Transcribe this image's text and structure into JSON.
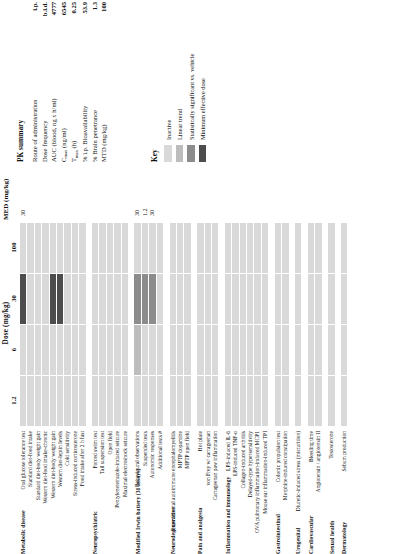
{
  "figure": {
    "dose_axis": {
      "title": "Dose (mg/kg)",
      "ticks": [
        "1.2",
        "6",
        "30",
        "100"
      ]
    },
    "med_column_title": "MED (mg/kg)"
  },
  "colors": {
    "inactive": "#d9d9d9",
    "linear_trend": "#bdbdbd",
    "significant": "#8c8c8c",
    "med": "#4d4d4d",
    "grid_line": "#ffffff",
    "text": "#111111"
  },
  "key": {
    "title": "Key",
    "items": [
      {
        "label": "Inactive",
        "color_key": "inactive"
      },
      {
        "label": "Linear trend",
        "color_key": "linear_trend"
      },
      {
        "label": "Statistically significant vs. vehicle",
        "color_key": "significant"
      },
      {
        "label": "Minimum effective dose",
        "color_key": "med"
      }
    ]
  },
  "pk_summary": {
    "title": "PK summary",
    "rows": [
      {
        "label": "Route of administration",
        "value": "i.p."
      },
      {
        "label": "Dose frequency",
        "value": "b.i.d."
      },
      {
        "label": "AUC (blood, ng x h/ml)",
        "value": "4777"
      },
      {
        "label": "Cmax (ng/ml)",
        "label_main": "C",
        "label_sub": "max",
        "label_tail": " (ng/ml)",
        "value": "6545"
      },
      {
        "label": "Tmax (h)",
        "label_main": "T",
        "label_sub": "max",
        "label_tail": " (h)",
        "value": "0.25"
      },
      {
        "label": "% i.p. Bioavailability",
        "value": "53.9"
      },
      {
        "label": "% Brain penetrance",
        "value": "1.3"
      },
      {
        "label": "MTD (mg/kg)",
        "value": "100"
      }
    ]
  },
  "categories": [
    {
      "name": "Metabolic disease",
      "rows": [
        {
          "label": "Oral glucose tolerance test",
          "cells": [
            "inactive",
            "inactive",
            "med",
            "inactive"
          ],
          "med": "30"
        },
        {
          "label": "Standard diet-food intake",
          "cells": [
            "inactive",
            "inactive",
            "inactive",
            "inactive"
          ],
          "med": ""
        },
        {
          "label": "Standard diet-body weight gain",
          "cells": [
            "inactive",
            "inactive",
            "inactive",
            "inactive"
          ],
          "med": ""
        },
        {
          "label": "Western diet-food intake-chronic",
          "cells": [
            "inactive",
            "inactive",
            "inactive",
            "inactive"
          ],
          "med": ""
        },
        {
          "label": "Western diet-body weight gain",
          "cells": [
            "inactive",
            "inactive",
            "med",
            "inactive"
          ],
          "med": ""
        },
        {
          "label": "Western diet-leptin levels",
          "cells": [
            "inactive",
            "inactive",
            "med",
            "inactive"
          ],
          "med": ""
        },
        {
          "label": "Cold sensitivity",
          "cells": [
            "inactive",
            "inactive",
            "inactive",
            "inactive"
          ],
          "med": ""
        },
        {
          "label": "Stress-induced corticosterone",
          "cells": [
            "inactive",
            "inactive",
            "inactive",
            "inactive"
          ],
          "med": ""
        },
        {
          "label": "Food intake after 2 h fast",
          "cells": [
            "inactive",
            "inactive",
            "inactive",
            "inactive"
          ],
          "med": ""
        }
      ]
    },
    {
      "name": "Neuropsychiatric",
      "rows": [
        {
          "label": "Forced swim test",
          "cells": [
            "inactive",
            "inactive",
            "inactive",
            "inactive"
          ],
          "med": ""
        },
        {
          "label": "Tail suspension test",
          "cells": [
            "inactive",
            "inactive",
            "inactive",
            "inactive"
          ],
          "med": ""
        },
        {
          "label": "Open field",
          "cells": [
            "inactive",
            "inactive",
            "inactive",
            "inactive"
          ],
          "med": ""
        },
        {
          "label": "Pentylenetetrazole-induced seizure",
          "cells": [
            "inactive",
            "inactive",
            "inactive",
            "inactive"
          ],
          "med": ""
        },
        {
          "label": "Maximal electroshock seizure",
          "cells": [
            "inactive",
            "inactive",
            "inactive",
            "inactive"
          ],
          "med": ""
        }
      ]
    },
    {
      "name": "Modified Irwin battery (31 assays)",
      "rows": [
        {
          "label": "Behavioural observations",
          "cells": [
            "inactive",
            "linear_trend",
            "significant",
            "inactive"
          ],
          "med": "30"
        },
        {
          "label": "Suspended tests",
          "cells": [
            "inactive",
            "inactive",
            "significant",
            "inactive"
          ],
          "med": "1.2"
        },
        {
          "label": "Autonomic responses",
          "cells": [
            "inactive",
            "inactive",
            "significant",
            "inactive"
          ],
          "med": "30"
        },
        {
          "label": "Additional tests #",
          "cells": [
            "inactive",
            "inactive",
            "inactive",
            "inactive"
          ],
          "med": ""
        }
      ]
    },
    {
      "name": "Neurodegenerative",
      "rows": [
        {
          "label": "Experimental autoimmune encephalomyelitis",
          "cells": [
            "inactive",
            "inactive",
            "inactive",
            "inactive"
          ],
          "med": ""
        },
        {
          "label": "MPTP dopamine",
          "cells": [
            "inactive",
            "inactive",
            "inactive",
            "inactive"
          ],
          "med": ""
        },
        {
          "label": "MPTP open field",
          "cells": [
            "inactive",
            "inactive",
            "inactive",
            "inactive"
          ],
          "med": ""
        }
      ]
    },
    {
      "name": "Pain and analgesia",
      "rows": [
        {
          "label": "Hot plate",
          "cells": [
            "inactive",
            "inactive",
            "inactive",
            "inactive"
          ],
          "med": ""
        },
        {
          "label": "von Frey w/ carrageenan",
          "cells": [
            "inactive",
            "inactive",
            "inactive",
            "inactive"
          ],
          "med": ""
        },
        {
          "label": "Carrageenan paw inflammation",
          "cells": [
            "inactive",
            "inactive",
            "inactive",
            "inactive"
          ],
          "med": ""
        }
      ]
    },
    {
      "name": "Inflammation and immunology",
      "rows": [
        {
          "label": "LPS-induced IL-6",
          "cells": [
            "inactive",
            "inactive",
            "inactive",
            "inactive"
          ],
          "med": ""
        },
        {
          "label": "LPS-induced TNF-α",
          "cells": [
            "inactive",
            "inactive",
            "inactive",
            "inactive"
          ],
          "med": ""
        },
        {
          "label": "Collagen-induced arthritis",
          "cells": [
            "inactive",
            "inactive",
            "inactive",
            "inactive"
          ],
          "med": ""
        },
        {
          "label": "Delayed-type hypersensitivity",
          "cells": [
            "inactive",
            "inactive",
            "inactive",
            "inactive"
          ],
          "med": ""
        },
        {
          "label": "OVA pulmonary inflammation-induced MCP1",
          "cells": [
            "inactive",
            "inactive",
            "inactive",
            "inactive"
          ],
          "med": ""
        },
        {
          "label": "Mouse ear inflammation-induced TPI",
          "cells": [
            "inactive",
            "inactive",
            "inactive",
            "inactive"
          ],
          "med": ""
        }
      ]
    },
    {
      "name": "Gastrointestinal",
      "rows": [
        {
          "label": "Colonic propulsion test",
          "cells": [
            "inactive",
            "inactive",
            "inactive",
            "inactive"
          ],
          "med": ""
        },
        {
          "label": "Morphine-induced constipation",
          "cells": [
            "inactive",
            "inactive",
            "inactive",
            "inactive"
          ],
          "med": ""
        }
      ]
    },
    {
      "name": "Urogenital",
      "rows": [
        {
          "label": "Diuretic-induced stress (micturition)",
          "cells": [
            "inactive",
            "inactive",
            "inactive",
            "inactive"
          ],
          "med": ""
        }
      ]
    },
    {
      "name": "Cardiovascular",
      "rows": [
        {
          "label": "Bleeding time",
          "cells": [
            "inactive",
            "inactive",
            "inactive",
            "inactive"
          ],
          "med": ""
        },
        {
          "label": "Angiotensin / angiotensin II",
          "cells": [
            "inactive",
            "inactive",
            "inactive",
            "inactive"
          ],
          "med": ""
        }
      ]
    },
    {
      "name": "Sexual health",
      "rows": [
        {
          "label": "Testosterone",
          "cells": [
            "inactive",
            "inactive",
            "inactive",
            "inactive"
          ],
          "med": ""
        }
      ]
    },
    {
      "name": "Dermatology",
      "rows": [
        {
          "label": "Sebum production",
          "cells": [
            "inactive",
            "inactive",
            "inactive",
            "inactive"
          ],
          "med": ""
        }
      ]
    }
  ]
}
